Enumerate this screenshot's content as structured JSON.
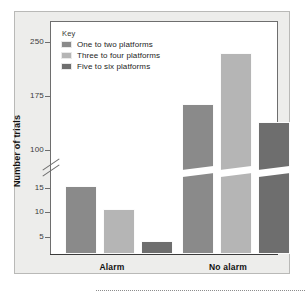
{
  "chart_data": {
    "type": "bar",
    "title": "",
    "subtitle": "",
    "xlabel": "",
    "ylabel": "Number of trials",
    "categories": [
      "Alarm",
      "No alarm"
    ],
    "series": [
      {
        "name": "One to two platforms",
        "color": "#8a8a8a",
        "values": [
          14,
          135
        ]
      },
      {
        "name": "Three to four platforms",
        "color": "#b5b5b5",
        "values": [
          9.5,
          235
        ]
      },
      {
        "name": "Five to six platforms",
        "color": "#6e6e6e",
        "values": [
          2.5,
          115
        ]
      }
    ],
    "legend_title": "Key",
    "legend_position": "top-left-inside",
    "grid": false,
    "axis_break": true,
    "axis_break_note": "y-axis broken between 15 and 100",
    "ylim_lower": [
      0,
      15
    ],
    "ylim_upper": [
      100,
      250
    ],
    "yticks": [
      "5",
      "10",
      "15",
      "100",
      "175",
      "250"
    ],
    "ytick_values": [
      5,
      10,
      15,
      100,
      175,
      250
    ]
  },
  "axis": {
    "y_title": "Number of trials",
    "ticks": [
      {
        "label": "250",
        "y": 42
      },
      {
        "label": "175",
        "y": 96
      },
      {
        "label": "100",
        "y": 150
      },
      {
        "label": "15",
        "y": 188
      },
      {
        "label": "10",
        "y": 212
      },
      {
        "label": "5",
        "y": 237
      }
    ]
  },
  "legend": {
    "title": "Key",
    "items": [
      {
        "label": "One to two platforms",
        "color": "#8a8a8a"
      },
      {
        "label": "Three to four platforms",
        "color": "#b5b5b5"
      },
      {
        "label": "Five to six platforms",
        "color": "#6e6e6e"
      }
    ]
  },
  "groups": [
    {
      "label": "Alarm",
      "center_x": 112
    },
    {
      "label": "No alarm",
      "center_x": 228
    }
  ],
  "bars": [
    {
      "name": "alarm-one-to-two",
      "left": 14,
      "width": 32,
      "height": 68,
      "color": "#8a8a8a",
      "broken": false
    },
    {
      "name": "alarm-three-to-four",
      "left": 52,
      "width": 32,
      "height": 45,
      "color": "#b5b5b5",
      "broken": false
    },
    {
      "name": "alarm-five-to-six",
      "left": 90,
      "width": 32,
      "height": 13,
      "color": "#6e6e6e",
      "broken": false
    },
    {
      "name": "noalarm-one-to-two",
      "left": 131,
      "width": 32,
      "height": 150,
      "color": "#8a8a8a",
      "broken": true
    },
    {
      "name": "noalarm-three-to-four",
      "left": 169,
      "width": 32,
      "height": 201,
      "color": "#b5b5b5",
      "broken": true
    },
    {
      "name": "noalarm-five-to-six",
      "left": 207,
      "width": 32,
      "height": 132,
      "color": "#6e6e6e",
      "broken": true
    }
  ]
}
